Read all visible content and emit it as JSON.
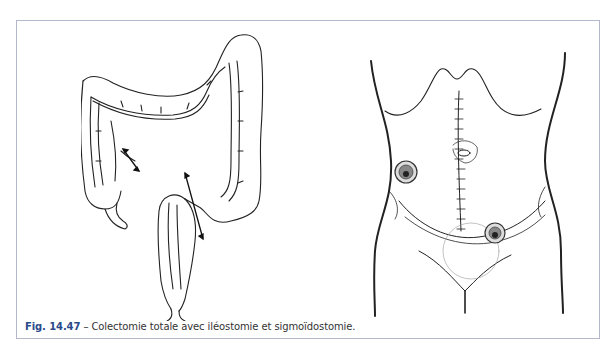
{
  "figure": {
    "label": "Fig. 14.47",
    "separator": " – ",
    "caption": "Colectomie totale avec iléostomie et sigmoïdostomie.",
    "border_color": "#b4b8cc",
    "label_color": "#2a4a8a",
    "illustrations": [
      {
        "name": "colon-diagram",
        "description": "Colon with resection arrows"
      },
      {
        "name": "abdomen-diagram",
        "description": "Abdomen with midline incision, ileostomy and sigmoidostomy stomas"
      }
    ]
  }
}
